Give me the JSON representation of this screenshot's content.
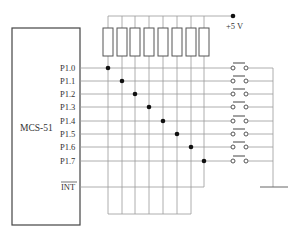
{
  "diagram": {
    "mcu_label": "MCS-51",
    "supply_label": "+5 V",
    "pins": [
      "P1.0",
      "P1.1",
      "P1.2",
      "P1.3",
      "P1.4",
      "P1.5",
      "P1.6",
      "P1.7"
    ],
    "interrupt_pin": "INT",
    "resistor_count": 8,
    "switch_count": 8,
    "colors": {
      "wire": "#999999",
      "outline": "#444444",
      "junction": "#111111"
    }
  }
}
